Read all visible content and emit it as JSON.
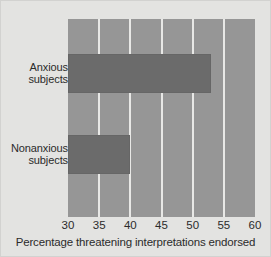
{
  "chart_data": {
    "type": "bar",
    "orientation": "horizontal",
    "title": "",
    "subtitle": "",
    "categories": [
      "Anxious subjects",
      "Nonanxious subjects"
    ],
    "category_lines": [
      [
        "Anxious",
        "subjects"
      ],
      [
        "Nonanxious",
        "subjects"
      ]
    ],
    "values": [
      53,
      40
    ],
    "xlabel": "Percentage threatening interpretations endorsed",
    "ylabel": "",
    "xlim": [
      30,
      60
    ],
    "ylim": null,
    "xticks": [
      30,
      35,
      40,
      45,
      50,
      55,
      60
    ],
    "xtick_labels": [
      "30",
      "35",
      "40",
      "45",
      "50",
      "55",
      "60"
    ],
    "grid": true,
    "grid_axis": "x",
    "legend": null,
    "legend_position": "none",
    "annotations": [],
    "colors": {
      "figure_background": "#e3e3e1",
      "plot_background": "#969696",
      "bar": "#6b6b6b",
      "gridline": "#e8e8e6",
      "text": "#2b2b2b"
    }
  }
}
